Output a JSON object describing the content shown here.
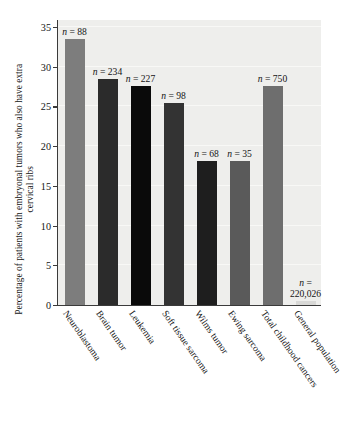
{
  "chart_data": {
    "type": "bar",
    "title": "",
    "xlabel": "",
    "ylabel": "Percentage of patients with embryonal tumors who also have extra cervical ribs",
    "ylim": [
      0,
      36
    ],
    "yticks": [
      0,
      5,
      10,
      15,
      20,
      25,
      30,
      35
    ],
    "ytick_labels": [
      "0",
      "5",
      "10",
      "15",
      "20",
      "25",
      "30",
      "35"
    ],
    "grid": true,
    "legend": "none",
    "categories": [
      "Neuroblastoma",
      "Brain tumor",
      "Leukemia",
      "Soft tissue sarcoma",
      "Wilms tumor",
      "Ewing sarcoma",
      "Total childhood cancers",
      "General population"
    ],
    "values": [
      33.5,
      28.5,
      27.6,
      25.4,
      18.1,
      18.1,
      27.6,
      0.5
    ],
    "annotations": [
      "n = 88",
      "n = 234",
      "n = 227",
      "n = 98",
      "n = 68",
      "n = 35",
      "n = 750",
      "n = 220,026"
    ],
    "bar_colors": [
      "#7d7d7d",
      "#2b2b2b",
      "#0a0a0a",
      "#333333",
      "#1e1e1e",
      "#5a5a5a",
      "#6e6e6e",
      "#d8d8d6"
    ],
    "plot_background": "#eeeeec",
    "axis_color": "#3a3a3a",
    "text_color": "#141414"
  },
  "annotation_parts": [
    {
      "n": "n",
      "eq": " = 88",
      "multiline": false,
      "line2": ""
    },
    {
      "n": "n",
      "eq": " = 234",
      "multiline": false,
      "line2": ""
    },
    {
      "n": "n",
      "eq": " = 227",
      "multiline": false,
      "line2": ""
    },
    {
      "n": "n",
      "eq": " = 98",
      "multiline": false,
      "line2": ""
    },
    {
      "n": "n",
      "eq": " = 68",
      "multiline": false,
      "line2": ""
    },
    {
      "n": "n",
      "eq": " = 35",
      "multiline": false,
      "line2": ""
    },
    {
      "n": "n",
      "eq": " = 750",
      "multiline": false,
      "line2": ""
    },
    {
      "n": "n",
      "eq": " =",
      "multiline": true,
      "line2": "220,026"
    }
  ]
}
